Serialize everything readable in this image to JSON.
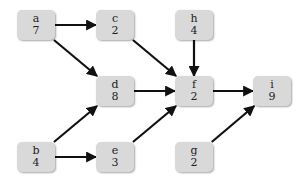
{
  "diagram": {
    "type": "directed-acyclic-graph",
    "nodes": [
      {
        "id": "a",
        "label": "a",
        "value": "7",
        "x": 17,
        "y": 10
      },
      {
        "id": "c",
        "label": "c",
        "value": "2",
        "x": 96,
        "y": 10
      },
      {
        "id": "h",
        "label": "h",
        "value": "4",
        "x": 175,
        "y": 10
      },
      {
        "id": "d",
        "label": "d",
        "value": "8",
        "x": 96,
        "y": 76
      },
      {
        "id": "f",
        "label": "f",
        "value": "2",
        "x": 175,
        "y": 76
      },
      {
        "id": "i",
        "label": "i",
        "value": "9",
        "x": 253,
        "y": 76
      },
      {
        "id": "b",
        "label": "b",
        "value": "4",
        "x": 17,
        "y": 142
      },
      {
        "id": "e",
        "label": "e",
        "value": "3",
        "x": 96,
        "y": 142
      },
      {
        "id": "g",
        "label": "g",
        "value": "2",
        "x": 175,
        "y": 142
      }
    ],
    "edges": [
      {
        "from": "a",
        "to": "c"
      },
      {
        "from": "a",
        "to": "d"
      },
      {
        "from": "c",
        "to": "f"
      },
      {
        "from": "h",
        "to": "f"
      },
      {
        "from": "d",
        "to": "f"
      },
      {
        "from": "b",
        "to": "d"
      },
      {
        "from": "b",
        "to": "e"
      },
      {
        "from": "e",
        "to": "f"
      },
      {
        "from": "f",
        "to": "i"
      },
      {
        "from": "g",
        "to": "i"
      }
    ],
    "colors": {
      "node_fill": "#d9d9d9",
      "edge": "#111111",
      "background": "#ffffff"
    }
  }
}
